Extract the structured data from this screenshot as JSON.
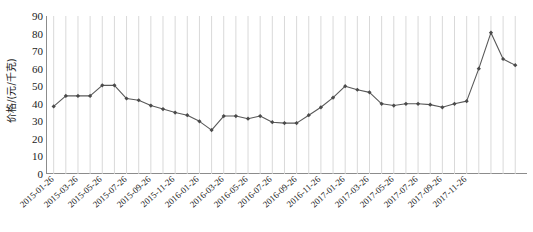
{
  "chart_data": {
    "type": "line",
    "title": "",
    "subtitle": "",
    "xlabel": "",
    "ylabel": "价格/(元/千克)",
    "ylim": [
      0,
      90
    ],
    "ytick_values": [
      0,
      10,
      20,
      30,
      40,
      50,
      60,
      70,
      80,
      90
    ],
    "ytick_labels": [
      "0",
      "10",
      "20",
      "30",
      "40",
      "50",
      "60",
      "70",
      "80",
      "90"
    ],
    "grid": "vertical",
    "legend": "none",
    "marker": "diamond",
    "line_color": "#595959",
    "marker_color": "#4a4a4a",
    "gridline_color": "#d9d9d9",
    "axis_color": "#8c8c8c",
    "x": [
      "2015-01-26",
      "2015-02-26",
      "2015-03-26",
      "2015-04-26",
      "2015-05-26",
      "2015-06-26",
      "2015-07-26",
      "2015-08-26",
      "2015-09-26",
      "2015-10-26",
      "2015-11-26",
      "2015-12-26",
      "2016-01-26",
      "2016-02-26",
      "2016-03-26",
      "2016-04-26",
      "2016-05-26",
      "2016-06-26",
      "2016-07-26",
      "2016-08-26",
      "2016-09-26",
      "2016-10-26",
      "2016-11-26",
      "2016-12-26",
      "2017-01-26",
      "2017-02-26",
      "2017-03-26",
      "2017-04-26",
      "2017-05-26",
      "2017-06-26",
      "2017-07-26",
      "2017-08-26",
      "2017-09-26",
      "2017-10-26",
      "2017-11-26",
      "2017-12-26",
      "2018-01-26"
    ],
    "xtick_labels": [
      "2015-01-26",
      "2015-03-26",
      "2015-05-26",
      "2015-07-26",
      "2015-09-26",
      "2015-11-26",
      "2016-01-26",
      "2016-03-26",
      "2016-05-26",
      "2016-07-26",
      "2016-09-26",
      "2016-11-26",
      "2017-01-26",
      "2017-03-26",
      "2017-05-26",
      "2017-07-26",
      "2017-09-26",
      "2017-11-26"
    ],
    "xtick_indices": [
      0,
      2,
      4,
      6,
      8,
      10,
      12,
      14,
      16,
      18,
      20,
      22,
      24,
      26,
      28,
      30,
      32,
      34
    ],
    "values": [
      38.5,
      44.5,
      44.5,
      44.5,
      50.5,
      50.5,
      43.0,
      42.0,
      39.0,
      37.0,
      35.0,
      33.5,
      30.0,
      25.0,
      33.0,
      33.0,
      31.5,
      33.0,
      29.5,
      29.0,
      29.0,
      33.5,
      38.0,
      43.5,
      50.0,
      48.0,
      46.5,
      40.0,
      39.0,
      40.0,
      40.0,
      39.5,
      38.0,
      40.0,
      41.5,
      60.0,
      80.5
    ],
    "extra_values": [
      65.5,
      62.0
    ]
  }
}
